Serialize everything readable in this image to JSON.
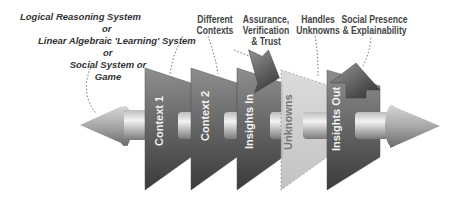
{
  "diagram": {
    "source_label": {
      "lines": [
        "Logical Reasoning System",
        "or",
        "Linear Algebraic 'Learning' System",
        "or",
        "Social System or Game"
      ]
    },
    "top_labels": [
      {
        "id": "contexts",
        "lines": [
          "Different",
          "Contexts"
        ]
      },
      {
        "id": "assurance",
        "lines": [
          "Assurance,",
          "Verification",
          "& Trust"
        ]
      },
      {
        "id": "unknowns",
        "lines": [
          "Handles",
          "Unknowns"
        ]
      },
      {
        "id": "social",
        "lines": [
          "Social Presence",
          "& Explainability"
        ]
      }
    ],
    "panels": [
      {
        "label": "Context 1",
        "style": "dark"
      },
      {
        "label": "Context 2",
        "style": "dark"
      },
      {
        "label": "Insights In",
        "style": "dark"
      },
      {
        "label": "Unknowns",
        "style": "light-dashed"
      },
      {
        "label": "Insights Out",
        "style": "dark"
      }
    ],
    "colors": {
      "panel_dark_top": "#8a8a8a",
      "panel_dark_bottom": "#3a3a3a",
      "panel_light": "#cfcfcf",
      "shaft_light": "#e8e8e8",
      "shaft_dark": "#8c8c8c",
      "text_dark": "#444444"
    }
  }
}
